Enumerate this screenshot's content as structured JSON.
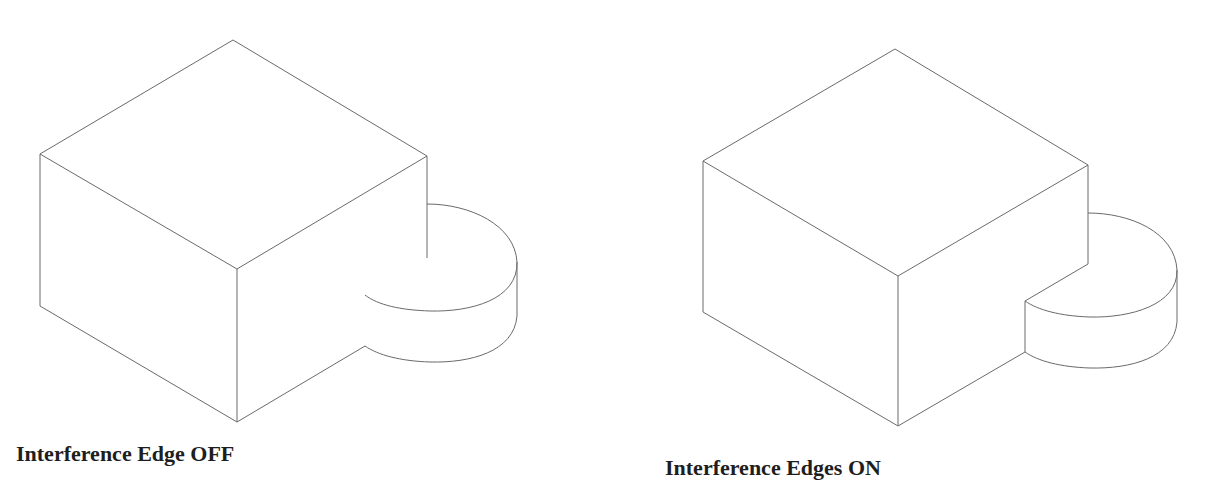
{
  "figures": [
    {
      "id": "left",
      "caption": "Interference Edge OFF",
      "interference_edges": false
    },
    {
      "id": "right",
      "caption": "Interference Edges ON",
      "interference_edges": true
    }
  ],
  "colors": {
    "background": "#ffffff",
    "line": "#6a6a6a",
    "caption_text": "#1e1e1e"
  }
}
